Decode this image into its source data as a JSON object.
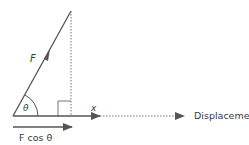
{
  "diagram": {
    "labels": {
      "force": "F",
      "angle": "θ",
      "x_axis": "x",
      "component": "F cos θ",
      "displacement": "Displacement"
    },
    "colors": {
      "line": "#555555",
      "text": "#3a3a3a"
    }
  }
}
